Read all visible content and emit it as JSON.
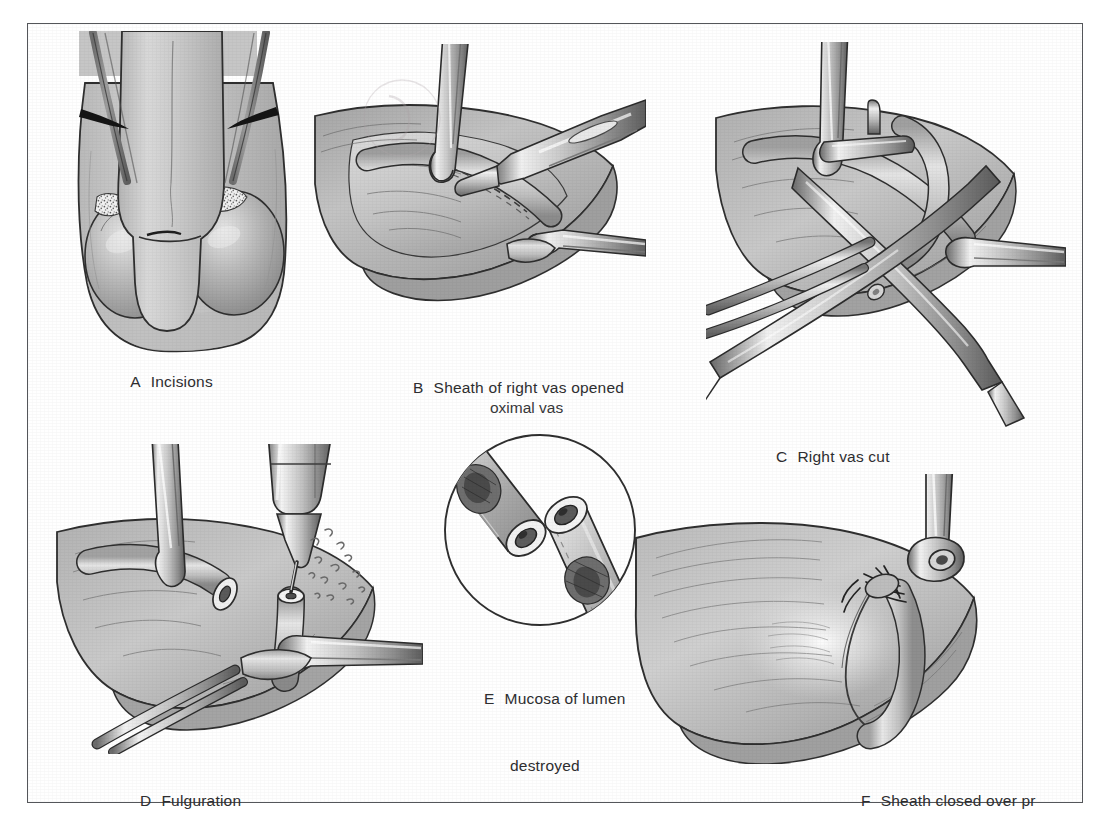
{
  "figure": {
    "style": "grayscale medical line illustration",
    "frame_color": "#54565a",
    "background_color": "#ffffff",
    "ink_color": "#2e2e30"
  },
  "panels": [
    {
      "id": "A",
      "label": "A",
      "title": "Incisions",
      "caption": "A   Incisions",
      "subject": "anterior view of scrotum and penis with bilateral vas incision marks"
    },
    {
      "id": "B",
      "label": "B",
      "title": "Sheath of right vas opened",
      "caption": "B   Sheath of right vas opened",
      "subject": "scalpel opening vas sheath held by two clamps in scrotal incision"
    },
    {
      "id": "C",
      "label": "C",
      "title": "Right vas cut",
      "caption": "C   Right vas cut",
      "subject": "scissors dividing the isolated vas deferens between clamps"
    },
    {
      "id": "D",
      "label": "D",
      "title": "Fulguration",
      "caption": "D   Fulguration",
      "subject": "electrocautery needle fulgurating the cut proximal vas lumen with sparks"
    },
    {
      "id": "E",
      "label": "E",
      "title": "Mucosa of lumen destroyed",
      "caption_line1": "E   Mucosa of lumen",
      "caption_line2": "destroyed",
      "subject": "circular magnified inset of two cut vas ends with destroyed lumen mucosa"
    },
    {
      "id": "F",
      "label": "F",
      "title": "Sheath closed over pr",
      "caption": "F   Sheath closed over pr",
      "subject": "sheath sutured closed over proximal vas stump held by clamp"
    }
  ],
  "annotations": {
    "inset_pointer_label": "oximal vas"
  }
}
